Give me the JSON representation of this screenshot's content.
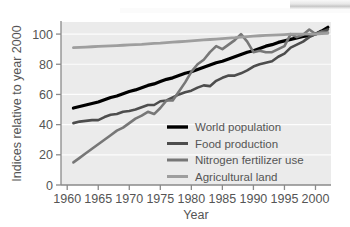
{
  "chart_data": {
    "type": "line",
    "title": "",
    "xlabel": "Year",
    "ylabel": "Indices relative to year 2000",
    "xlim": [
      1959,
      2002.5
    ],
    "ylim": [
      0,
      108
    ],
    "grid": true,
    "grid_color": "#ffffff",
    "plot_background": "#ebebeb",
    "legend_position": "center-right-inside",
    "xticks": [
      1960,
      1965,
      1970,
      1975,
      1980,
      1985,
      1990,
      1995,
      2000
    ],
    "xtick_labels": [
      "1960",
      "1965",
      "1970",
      "1975",
      "1980",
      "1985",
      "1990",
      "1995",
      "2000"
    ],
    "yticks": [
      0,
      20,
      40,
      60,
      80,
      100
    ],
    "ytick_labels": [
      "0",
      "20",
      "40",
      "60",
      "80",
      "100"
    ],
    "x": [
      1961,
      1962,
      1963,
      1964,
      1965,
      1966,
      1967,
      1968,
      1969,
      1970,
      1971,
      1972,
      1973,
      1974,
      1975,
      1976,
      1977,
      1978,
      1979,
      1980,
      1981,
      1982,
      1983,
      1984,
      1985,
      1986,
      1987,
      1988,
      1989,
      1990,
      1991,
      1992,
      1993,
      1994,
      1995,
      1996,
      1997,
      1998,
      1999,
      2000,
      2001,
      2002
    ],
    "series": [
      {
        "name": "World population",
        "color": "#000000",
        "width": 3.2,
        "values": [
          51,
          52,
          53,
          54,
          55,
          56.5,
          58,
          59,
          60.5,
          62,
          63,
          64.5,
          66,
          67,
          68.5,
          70,
          71,
          72.5,
          74,
          75,
          76.5,
          78,
          79.5,
          81,
          82,
          83.5,
          85,
          86.5,
          88,
          89,
          90.5,
          92,
          93,
          94.5,
          95.5,
          96.5,
          97.5,
          98.5,
          99,
          100,
          102,
          104.5
        ]
      },
      {
        "name": "Food production",
        "color": "#4d4d4d",
        "width": 2.6,
        "values": [
          41,
          42,
          42.5,
          43,
          43,
          45,
          46.5,
          47,
          48.5,
          49,
          50,
          51.5,
          53,
          53,
          55.5,
          56,
          58,
          60,
          61.5,
          62.5,
          64.5,
          66,
          65.5,
          69,
          71,
          72.5,
          72.5,
          74,
          76,
          78.5,
          80,
          81,
          82,
          85,
          87,
          91,
          93,
          95,
          98,
          100,
          101.5,
          103
        ]
      },
      {
        "name": "Nitrogen fertilizer use",
        "color": "#777777",
        "width": 2.6,
        "values": [
          15,
          18,
          21,
          24,
          27,
          30,
          33,
          36,
          38,
          41,
          44,
          46,
          48.5,
          47,
          51,
          56,
          56,
          62,
          68,
          75,
          80,
          83,
          88,
          92,
          90,
          93,
          96,
          100,
          95,
          88,
          89,
          88,
          88,
          90,
          92,
          100,
          98,
          99.5,
          103,
          100,
          101.5,
          101
        ]
      },
      {
        "name": "Agricultural land",
        "color": "#9e9e9e",
        "width": 2.8,
        "values": [
          91,
          91.2,
          91.4,
          91.6,
          91.8,
          92,
          92.2,
          92.4,
          92.6,
          92.8,
          93,
          93.2,
          93.5,
          93.8,
          94,
          94.3,
          94.6,
          94.9,
          95.2,
          95.5,
          95.8,
          96.1,
          96.4,
          96.7,
          97,
          97.3,
          97.6,
          98,
          98.3,
          98.6,
          98.9,
          99.1,
          99.3,
          99.5,
          99.7,
          99.9,
          100,
          100,
          100,
          100,
          100.3,
          100.5
        ]
      }
    ]
  },
  "legend": {
    "items": [
      {
        "label": "World population",
        "color": "#000000"
      },
      {
        "label": "Food production",
        "color": "#4d4d4d"
      },
      {
        "label": "Nitrogen fertilizer use",
        "color": "#777777"
      },
      {
        "label": "Agricultural land",
        "color": "#9e9e9e"
      }
    ]
  },
  "axes": {
    "y_title": "Indices relative to year 2000",
    "x_title": "Year"
  }
}
